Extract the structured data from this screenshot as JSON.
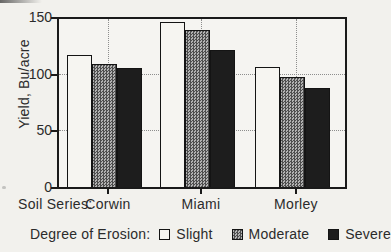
{
  "figure": {
    "background": "#f2f1ed",
    "frame_color": "#1a1a1a",
    "text_color": "#2b2b2b",
    "gridline_color": "#8d8d8d"
  },
  "chart_data": {
    "type": "bar",
    "title": "",
    "categories": [
      "Corwin",
      "Miami",
      "Morley"
    ],
    "series": [
      {
        "name": "Slight",
        "values": [
          118,
          147,
          107
        ],
        "fill": "#f6f5f1",
        "pattern": "none"
      },
      {
        "name": "Moderate",
        "values": [
          110,
          140,
          98
        ],
        "fill": "#9a9a9a",
        "pattern": "dither"
      },
      {
        "name": "Severe",
        "values": [
          106,
          122,
          88
        ],
        "fill": "#1d1d1d",
        "pattern": "solid"
      }
    ],
    "xlabel": "Soil Series:",
    "ylabel": "Yield, Bu/acre",
    "ylim": [
      0,
      150
    ],
    "yticks": [
      0,
      50,
      100,
      150
    ],
    "gridlines_y": [
      50,
      100
    ],
    "grid": true,
    "legend_title": "Degree of Erosion:",
    "legend_position": "bottom"
  }
}
